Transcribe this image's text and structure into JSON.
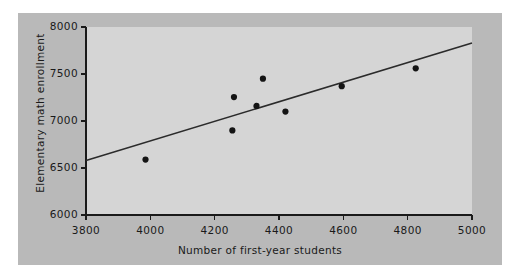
{
  "figure": {
    "background_color": "#b9b9b9",
    "panel_color": "#d5d5d5",
    "page_color": "#ffffff",
    "ink_color": "#1a1a1a"
  },
  "chart_data": {
    "type": "scatter",
    "title": "",
    "xlabel": "Number of first-year students",
    "ylabel": "Elementary math enrollment",
    "xlim": [
      3800,
      5000
    ],
    "ylim": [
      6000,
      8000
    ],
    "xticks": [
      3800,
      4000,
      4200,
      4400,
      4600,
      4800,
      5000
    ],
    "xtick_labels": [
      "3800",
      "4000",
      "4200",
      "4400",
      "4600",
      "4800",
      "5000"
    ],
    "yticks": [
      6000,
      6500,
      7000,
      7500,
      8000
    ],
    "ytick_labels": [
      "6000",
      "6500",
      "7000",
      "7500",
      "8000"
    ],
    "grid": false,
    "legend": null,
    "points": [
      {
        "x": 3985,
        "y": 6590
      },
      {
        "x": 4255,
        "y": 6900
      },
      {
        "x": 4260,
        "y": 7255
      },
      {
        "x": 4330,
        "y": 7160
      },
      {
        "x": 4350,
        "y": 7450
      },
      {
        "x": 4420,
        "y": 7100
      },
      {
        "x": 4595,
        "y": 7370
      },
      {
        "x": 4825,
        "y": 7560
      }
    ],
    "trendline": {
      "name": "least-squares regression line",
      "x_start": 3800,
      "y_start": 6580,
      "x_end": 5000,
      "y_end": 7830,
      "color": "#2b2b2b",
      "width": 1.6
    },
    "marker": {
      "shape": "circle",
      "color": "#141414",
      "radius": 3.1
    }
  }
}
